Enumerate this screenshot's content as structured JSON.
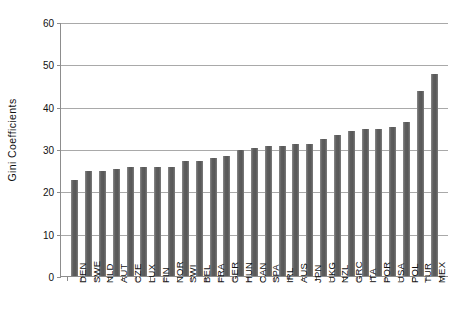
{
  "chart_data": {
    "type": "bar",
    "title": "",
    "xlabel": "",
    "ylabel": "Gini  Coefficients",
    "ylim": [
      0,
      60
    ],
    "yticks": [
      0,
      10,
      20,
      30,
      40,
      50,
      60
    ],
    "ytick_labels": [
      "0",
      "10",
      "20",
      "30",
      "40",
      "50",
      "60"
    ],
    "grid": "horizontal",
    "legend": "none",
    "bar_color": "#5e5e5e",
    "axis_color": "#8d8d8d",
    "gridline_color": "#a9a9a9",
    "categories": [
      "DEN",
      "SWE",
      "NLD",
      "AUT",
      "CZE",
      "LUX",
      "FIN",
      "NOR",
      "SWI",
      "BEL",
      "FRA",
      "GER",
      "HUN",
      "CAN",
      "SPA",
      "IRL",
      "AUS",
      "JPN",
      "UKG",
      "NZL",
      "GRC",
      "ITA",
      "POR",
      "USA",
      "POL",
      "TUR",
      "MEX"
    ],
    "values": [
      23,
      25,
      25,
      25.5,
      26,
      26,
      26,
      26,
      27.5,
      27.5,
      28,
      28.5,
      30,
      30.5,
      31,
      31,
      31.5,
      31.5,
      32.5,
      33.5,
      34.5,
      35,
      35,
      35.5,
      36.5,
      44,
      48
    ]
  }
}
